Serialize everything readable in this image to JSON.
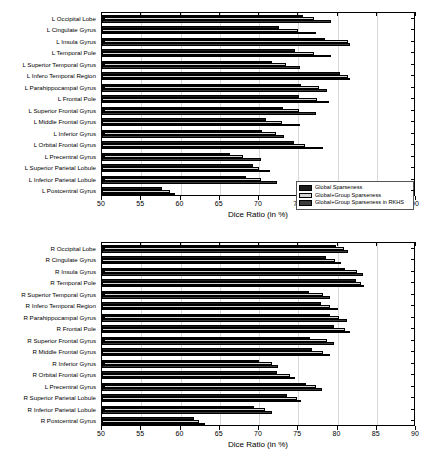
{
  "figure": {
    "width": 433,
    "height": 460,
    "background": "#ffffff"
  },
  "colors": {
    "series_1": "#1a1a1a",
    "series_2": "#d6d6d6",
    "series_3": "#3a3a3a",
    "axis": "#000000",
    "grid": "#d8d8d8"
  },
  "legend": {
    "position": "bottom-right",
    "entries": [
      "Global Sparseness",
      "Global+Group Sparseness",
      "Global+Group Sparseness in RKHS"
    ]
  },
  "chart_data": [
    {
      "type": "bar",
      "orientation": "horizontal",
      "title": "",
      "xlabel": "Dice Ratio (in %)",
      "ylabel": "",
      "xlim": [
        50,
        90
      ],
      "xticks": [
        50,
        55,
        60,
        65,
        70,
        75,
        80,
        85,
        90
      ],
      "grid": true,
      "legend": [
        "Global Sparseness",
        "Global+Group Sparseness",
        "Global+Group Sparseness in RKHS"
      ],
      "categories": [
        "L Occipital Lobe",
        "L Cingulate Gyrus",
        "L Insula Gyrus",
        "L Temporal Pole",
        "L Superior Temporal Gyrus",
        "L Infero Temporal Region",
        "L Parahippocampal Gyrus",
        "L Frontal Pole",
        "L Superior Frontal Gyrus",
        "L Middle Frontal Gyrus",
        "L Inferior Gyrus",
        "L Orbital Frontal Gyrus",
        "L Precentral Gyrus",
        "L Superior Parietal Lobule",
        "L Inferior Parietal Lobule",
        "L Postcentral Gyrus"
      ],
      "series": [
        {
          "name": "Global Sparseness",
          "values": [
            75.6,
            72.6,
            78.4,
            74.6,
            71.6,
            80.3,
            75.4,
            75.1,
            73.1,
            70.9,
            70.4,
            74.4,
            66.3,
            69.2,
            68.3,
            57.6
          ]
        },
        {
          "name": "Global+Group Sparseness",
          "values": [
            77.0,
            75.0,
            81.3,
            77.0,
            73.5,
            81.4,
            77.6,
            77.4,
            75.1,
            72.9,
            72.2,
            75.8,
            67.9,
            70.0,
            70.2,
            58.6
          ]
        },
        {
          "name": "Global+Group Sparseness in RKHS",
          "values": [
            79.2,
            77.3,
            81.6,
            79.2,
            75.2,
            81.6,
            78.7,
            78.9,
            77.2,
            75.2,
            73.2,
            78.1,
            70.2,
            71.4,
            72.3,
            59.3
          ]
        }
      ]
    },
    {
      "type": "bar",
      "orientation": "horizontal",
      "title": "",
      "xlabel": "Dice Ratio (in %)",
      "ylabel": "",
      "xlim": [
        50,
        90
      ],
      "xticks": [
        50,
        55,
        60,
        65,
        70,
        75,
        80,
        85,
        90
      ],
      "grid": true,
      "legend": [
        "Global Sparseness",
        "Global+Group Sparseness",
        "Global+Group Sparseness in RKHS"
      ],
      "categories": [
        "R Occipital Lobe",
        "R Cingulate Gyrus",
        "R Insula Gyrus",
        "R Temporal Pole",
        "R Superior Temporal Gyrus",
        "R Infero Temporal Region",
        "R Parahippocampal Gyrus",
        "R Frontal Pole",
        "R Superior Frontal Gyrus",
        "R Middle Frontal Gyrus",
        "R Inferior Gyrus",
        "R Orbital Frontal Gyrus",
        "L Precentral Gyrus",
        "R Superior Parietal Lobule",
        "R Inferior Parietal Lobule",
        "R Postcentral Gyrus"
      ],
      "series": [
        {
          "name": "Global Sparseness",
          "values": [
            79.8,
            78.5,
            81.0,
            82.4,
            76.4,
            77.9,
            79.0,
            79.6,
            76.5,
            76.7,
            70.0,
            72.3,
            76.0,
            73.6,
            69.3,
            61.7
          ]
        },
        {
          "name": "Global+Group Sparseness",
          "values": [
            80.8,
            79.7,
            82.5,
            83.0,
            78.1,
            79.1,
            80.2,
            81.0,
            78.7,
            78.2,
            71.7,
            74.0,
            77.2,
            74.8,
            70.8,
            62.4
          ]
        },
        {
          "name": "Global+Group Sparseness in RKHS",
          "values": [
            81.4,
            80.4,
            83.2,
            83.4,
            79.0,
            80.1,
            81.2,
            81.6,
            79.6,
            79.1,
            72.4,
            74.6,
            78.0,
            75.4,
            71.6,
            63.1
          ]
        }
      ]
    }
  ]
}
